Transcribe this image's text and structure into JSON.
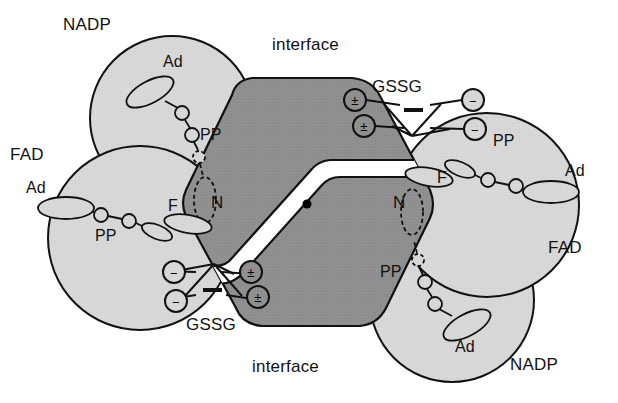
{
  "figure": {
    "type": "molecular-schematic",
    "background": "#ffffff",
    "colors": {
      "domain_fill": "#d6d6d6",
      "interface_fill": "#8e8e8e",
      "outline": "#111111",
      "channel_fill": "#ffffff",
      "axis_dot": "#000000",
      "text": "#111111"
    }
  },
  "labels": {
    "nadp_top": "NADP",
    "nadp_bottom": "NADP",
    "fad_left": "FAD",
    "fad_right": "FAD",
    "interface_top": "interface",
    "interface_bottom": "interface",
    "gssg_top": "GSSG",
    "gssg_bottom": "GSSG",
    "ad": "Ad",
    "pp": "PP",
    "f": "F",
    "n": "N",
    "plus_minus": "±",
    "minus": "−"
  },
  "domains": [
    {
      "name": "nadp-domain-top-left",
      "label": "NADP",
      "cx": 172,
      "cy": 118,
      "r": 82
    },
    {
      "name": "fad-domain-left",
      "label": "FAD",
      "cx": 140,
      "cy": 238,
      "r": 92
    },
    {
      "name": "fad-domain-right",
      "label": "FAD",
      "cx": 487,
      "cy": 205,
      "r": 92
    },
    {
      "name": "nadp-domain-bottom-right",
      "label": "NADP",
      "cx": 452,
      "cy": 300,
      "r": 82
    }
  ],
  "cofactors": {
    "nadp_top": {
      "ad_label": "Ad",
      "pp_label": "PP",
      "n_label": "N",
      "ad": {
        "cx": 150,
        "cy": 92,
        "rx": 26,
        "ry": 11,
        "rot": -28
      },
      "beads": [
        {
          "cx": 182,
          "cy": 113,
          "r": 7
        },
        {
          "cx": 192,
          "cy": 135,
          "r": 7
        }
      ],
      "dashed_bead": {
        "cx": 199,
        "cy": 157,
        "r": 6
      }
    },
    "fad_left": {
      "ad_label": "Ad",
      "pp_label": "PP",
      "f_label": "F",
      "ad": {
        "cx": 66,
        "cy": 208,
        "rx": 28,
        "ry": 11,
        "rot": 0
      },
      "beads": [
        {
          "cx": 101,
          "cy": 215,
          "r": 7
        },
        {
          "cx": 129,
          "cy": 221,
          "r": 7
        }
      ],
      "flavin": [
        {
          "cx": 157,
          "cy": 232,
          "rx": 16,
          "ry": 7,
          "rot": 22
        },
        {
          "cx": 186,
          "cy": 225,
          "rx": 23,
          "ry": 9,
          "rot": 10
        }
      ]
    },
    "fad_right": {
      "ad_label": "Ad",
      "pp_label": "PP",
      "f_label": "F",
      "ad": {
        "cx": 551,
        "cy": 192,
        "rx": 28,
        "ry": 11,
        "rot": 0
      },
      "beads": [
        {
          "cx": 516,
          "cy": 186,
          "r": 7
        },
        {
          "cx": 488,
          "cy": 180,
          "r": 7
        }
      ],
      "flavin": [
        {
          "cx": 460,
          "cy": 169,
          "rx": 16,
          "ry": 7,
          "rot": 22
        },
        {
          "cx": 431,
          "cy": 176,
          "rx": 23,
          "ry": 9,
          "rot": 10
        }
      ]
    },
    "nadp_bottom": {
      "ad_label": "Ad",
      "pp_label": "PP",
      "n_label": "N",
      "ad": {
        "cx": 467,
        "cy": 325,
        "rx": 26,
        "ry": 11,
        "rot": -28
      },
      "beads": [
        {
          "cx": 435,
          "cy": 304,
          "r": 7
        },
        {
          "cx": 425,
          "cy": 282,
          "r": 7
        }
      ],
      "dashed_bead": {
        "cx": 418,
        "cy": 260,
        "r": 6
      }
    }
  },
  "gssg_sites": [
    {
      "name": "gssg-site-top-right",
      "label": "GSSG",
      "plus_minus": [
        {
          "cx": 355,
          "cy": 100,
          "r": 11
        },
        {
          "cx": 364,
          "cy": 126,
          "r": 11
        }
      ],
      "minus": [
        {
          "cx": 473,
          "cy": 100,
          "r": 11
        },
        {
          "cx": 475,
          "cy": 129,
          "r": 11
        }
      ]
    },
    {
      "name": "gssg-site-bottom-left",
      "label": "GSSG",
      "plus_minus": [
        {
          "cx": 251,
          "cy": 272,
          "r": 11
        },
        {
          "cx": 258,
          "cy": 297,
          "r": 11
        }
      ],
      "minus": [
        {
          "cx": 174,
          "cy": 272,
          "r": 11
        },
        {
          "cx": 176,
          "cy": 301,
          "r": 11
        }
      ]
    }
  ],
  "interface": {
    "label_top": "interface",
    "label_bottom": "interface",
    "dyad_axis_dot": {
      "cx": 307,
      "cy": 204,
      "r": 4.5
    },
    "n_sites": [
      {
        "label": "N",
        "x": 211,
        "y": 208
      },
      {
        "label": "N",
        "x": 398,
        "y": 208
      }
    ]
  },
  "label_positions": {
    "nadp_top": {
      "x": 63,
      "y": 30
    },
    "fad_left": {
      "x": 10,
      "y": 160
    },
    "interface_top": {
      "x": 272,
      "y": 50
    },
    "gssg_top": {
      "x": 372,
      "y": 92
    },
    "fad_right": {
      "x": 548,
      "y": 253
    },
    "nadp_bottom": {
      "x": 510,
      "y": 370
    },
    "interface_bottom": {
      "x": 252,
      "y": 372
    },
    "gssg_bottom": {
      "x": 186,
      "y": 330
    },
    "ad_top": {
      "x": 163,
      "y": 67
    },
    "pp_top": {
      "x": 200,
      "y": 140
    },
    "ad_left": {
      "x": 26,
      "y": 193
    },
    "pp_left": {
      "x": 95,
      "y": 241
    },
    "f_left": {
      "x": 168,
      "y": 211
    },
    "n_left": {
      "x": 211,
      "y": 208
    },
    "f_right": {
      "x": 437,
      "y": 183
    },
    "pp_right": {
      "x": 493,
      "y": 146
    },
    "ad_right": {
      "x": 565,
      "y": 176
    },
    "n_right": {
      "x": 393,
      "y": 208
    },
    "pp_bottom": {
      "x": 380,
      "y": 277
    },
    "ad_bottom": {
      "x": 455,
      "y": 352
    }
  }
}
